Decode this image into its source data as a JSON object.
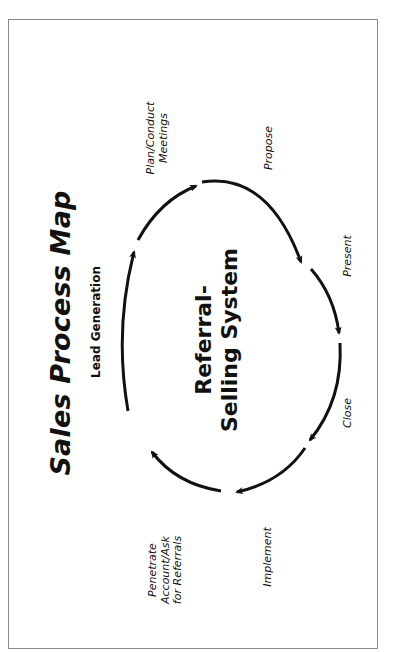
{
  "diagram": {
    "title": "Sales Process Map",
    "center_label": {
      "line1": "Referral-",
      "line2": "Selling System"
    },
    "steps": [
      {
        "id": "lead-generation",
        "label": "Lead Generation"
      },
      {
        "id": "plan-conduct-meetings",
        "line1": "Plan/Conduct",
        "line2": "Meetings"
      },
      {
        "id": "propose",
        "label": "Propose"
      },
      {
        "id": "present",
        "label": "Present"
      },
      {
        "id": "close",
        "label": "Close"
      },
      {
        "id": "implement",
        "label": "Implement"
      },
      {
        "id": "penetrate-account",
        "line1": "Penetrate",
        "line2": "Account/Ask",
        "line3": "for Referrals"
      }
    ],
    "flow": [
      "Lead Generation",
      "Plan/Conduct Meetings",
      "Propose",
      "Present",
      "Close",
      "Implement",
      "Penetrate Account/Ask for Referrals"
    ],
    "orientation": "rotated -90 degrees",
    "colors": {
      "arrow": "#111111",
      "border": "#8a8a8a",
      "background": "#ffffff"
    }
  }
}
